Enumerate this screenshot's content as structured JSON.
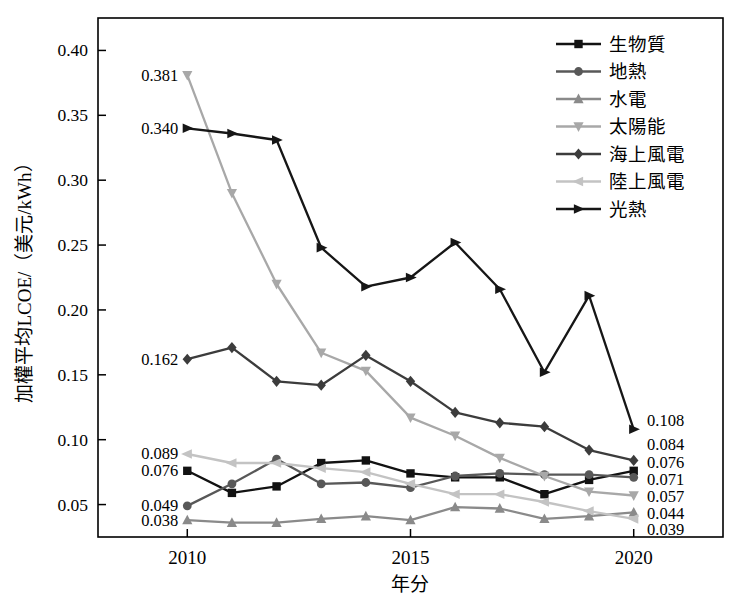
{
  "figure": {
    "background": "#ffffff",
    "axis_color": "#000000"
  },
  "chart_data": {
    "type": "line",
    "title": "",
    "xlabel": "年分",
    "ylabel": "加權平均LCOE/（美元/kWh）",
    "x": [
      2010,
      2011,
      2012,
      2013,
      2014,
      2015,
      2016,
      2017,
      2018,
      2019,
      2020
    ],
    "xlim": [
      2008,
      2022
    ],
    "ylim": [
      0.025,
      0.425
    ],
    "xtick_values": [
      2010,
      2015,
      2020
    ],
    "xtick_labels": [
      "2010",
      "2015",
      "2020"
    ],
    "ytick_values": [
      0.05,
      0.1,
      0.15,
      0.2,
      0.25,
      0.3,
      0.35,
      0.4
    ],
    "ytick_labels": [
      "0.05",
      "0.10",
      "0.15",
      "0.20",
      "0.25",
      "0.30",
      "0.35",
      "0.40"
    ],
    "grid": false,
    "legend_position": "top-right",
    "series": [
      {
        "id": "biomass",
        "name": "生物質",
        "marker": "square",
        "color": "#121212",
        "values": [
          0.076,
          0.059,
          0.064,
          0.082,
          0.084,
          0.074,
          0.071,
          0.071,
          0.058,
          0.069,
          0.076
        ],
        "start_label": "0.076",
        "end_label": "0.076"
      },
      {
        "id": "geothermal",
        "name": "地熱",
        "marker": "circle",
        "color": "#585858",
        "values": [
          0.049,
          0.066,
          0.085,
          0.066,
          0.067,
          0.063,
          0.072,
          0.074,
          0.073,
          0.073,
          0.071
        ],
        "start_label": "0.049",
        "end_label": "0.071"
      },
      {
        "id": "hydro",
        "name": "水電",
        "marker": "triangle-up",
        "color": "#8a8a8a",
        "values": [
          0.038,
          0.036,
          0.036,
          0.039,
          0.041,
          0.038,
          0.048,
          0.047,
          0.039,
          0.041,
          0.044
        ],
        "start_label": "0.038",
        "end_label": "0.044"
      },
      {
        "id": "solar-pv",
        "name": "太陽能",
        "marker": "triangle-down",
        "color": "#a8a8a8",
        "values": [
          0.381,
          0.29,
          0.22,
          0.167,
          0.153,
          0.117,
          0.103,
          0.086,
          0.072,
          0.06,
          0.057
        ],
        "start_label": "0.381",
        "end_label": "0.057"
      },
      {
        "id": "offshore-wind",
        "name": "海上風電",
        "marker": "diamond",
        "color": "#3c3c3c",
        "values": [
          0.162,
          0.171,
          0.145,
          0.142,
          0.165,
          0.145,
          0.121,
          0.113,
          0.11,
          0.092,
          0.084
        ],
        "start_label": "0.162",
        "end_label": "0.084"
      },
      {
        "id": "onshore-wind",
        "name": "陸上風電",
        "marker": "triangle-left",
        "color": "#c3c3c3",
        "values": [
          0.089,
          0.082,
          0.082,
          0.078,
          0.075,
          0.066,
          0.058,
          0.058,
          0.052,
          0.045,
          0.039
        ],
        "start_label": "0.089",
        "end_label": "0.039"
      },
      {
        "id": "csp",
        "name": "光熱",
        "marker": "triangle-right",
        "color": "#161616",
        "values": [
          0.34,
          0.336,
          0.331,
          0.248,
          0.218,
          0.225,
          0.252,
          0.216,
          0.152,
          0.211,
          0.108
        ],
        "start_label": "0.340",
        "end_label": "0.108"
      }
    ]
  }
}
